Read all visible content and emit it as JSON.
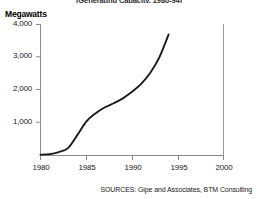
{
  "chart_data": {
    "type": "line",
    "title": "(Generating Capacity, 1980-94)",
    "ylabel": "Megawatts",
    "xlabel": "",
    "xlim": [
      1980,
      2000
    ],
    "ylim": [
      0,
      4000
    ],
    "grid": false,
    "legend": "none",
    "xticks": [
      "1980",
      "1985",
      "1990",
      "1995",
      "2000"
    ],
    "xtick_values": [
      1980,
      1985,
      1990,
      1995,
      2000
    ],
    "yticks": [
      "1,000",
      "2,000",
      "3,000",
      "4,000"
    ],
    "ytick_values": [
      1000,
      2000,
      3000,
      4000
    ],
    "series": [
      {
        "name": "World wind generating capacity",
        "x": [
          1980,
          1981,
          1982,
          1983,
          1984,
          1985,
          1986,
          1987,
          1988,
          1989,
          1990,
          1991,
          1992,
          1993,
          1994
        ],
        "values": [
          10,
          25,
          90,
          210,
          600,
          1020,
          1270,
          1450,
          1580,
          1730,
          1930,
          2170,
          2510,
          2990,
          3680
        ]
      }
    ],
    "source": "SOURCES: Gipe and Associates, BTM Consulting"
  },
  "figure": {
    "title": "(Generating Capacity, 1980-94)",
    "y_axis_title": "Megawatts",
    "source_note": "SOURCES: Gipe and Associates, BTM Consulting"
  },
  "colors": {
    "line": "#1a1a1a",
    "axis": "#808080",
    "text": "#1a1a1a",
    "background": "#ffffff"
  }
}
